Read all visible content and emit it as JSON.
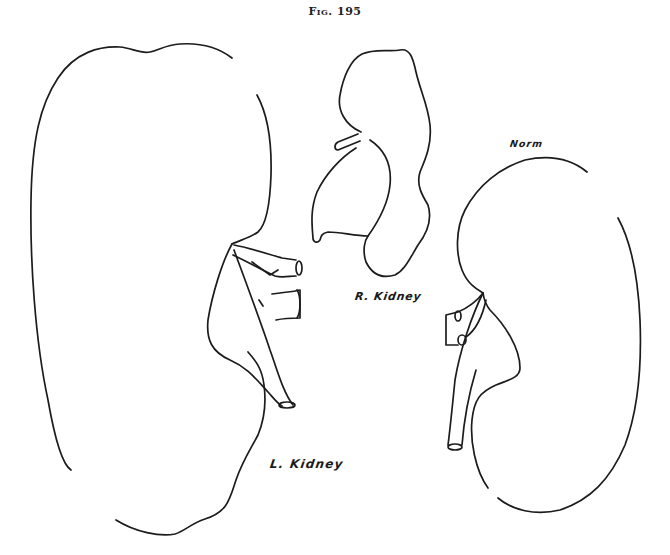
{
  "figure": {
    "title": "Fig. 195",
    "colors": {
      "ink": "#1c1c1c",
      "paper": "#ffffff"
    },
    "labels": {
      "normal": "Norm",
      "right_kidney": "R. Kidney",
      "left_kidney": "L. Kidney"
    },
    "specimens": [
      {
        "id": "left-kidney",
        "label": "L. Kidney",
        "description": "Greatly enlarged left kidney outline with hilum vessels and ureter"
      },
      {
        "id": "right-kidney",
        "label": "R. Kidney",
        "description": "Small, lobulated right kidney with short vessel stub"
      },
      {
        "id": "normal-kidney",
        "label": "Norm",
        "description": "Normal-size kidney outline for comparison with vessels and ureter"
      }
    ]
  }
}
